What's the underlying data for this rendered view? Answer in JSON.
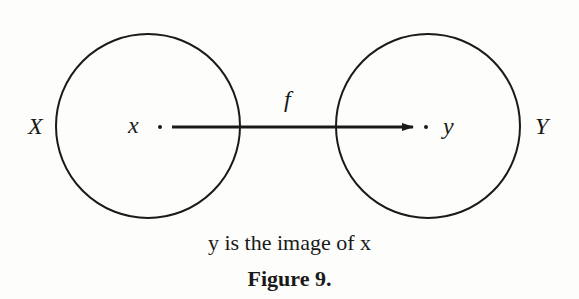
{
  "diagram": {
    "set_domain_label": "X",
    "set_codomain_label": "Y",
    "point_domain_label": "x",
    "point_codomain_label": "y",
    "function_label": "f",
    "caption": "y is the image of x",
    "figure_label": "Figure 9."
  }
}
